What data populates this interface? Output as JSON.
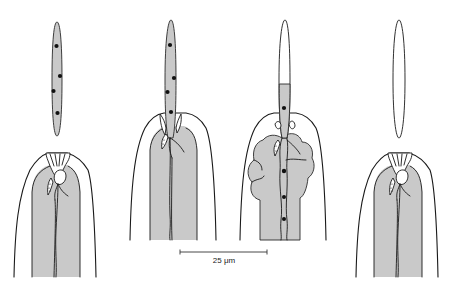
{
  "figure": {
    "panels": [
      {
        "id": "stage-1",
        "stylet": "detached, stippled with nuclei",
        "nuclei_in_stylet": 4
      },
      {
        "id": "stage-2",
        "stylet": "inserted into head, stippled with nuclei",
        "nuclei_in_stylet": 4
      },
      {
        "id": "stage-3",
        "stylet": "inserted, partially filled",
        "nuclei_in_stylet": 1
      },
      {
        "id": "stage-4",
        "stylet": "detached, empty",
        "nuclei_in_stylet": 0
      }
    ],
    "scale_bar": {
      "label": "25 μm",
      "value": 25,
      "unit": "μm"
    }
  }
}
